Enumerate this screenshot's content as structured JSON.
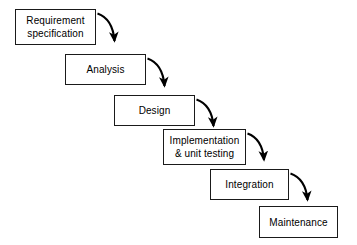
{
  "diagram": {
    "type": "flow-diagram",
    "background_color": "#ffffff",
    "box_fill_color": "#ffffff",
    "box_border_color": "#1a1a1a",
    "text_color": "#000000",
    "arrow_color": "#000000",
    "phases": [
      {
        "id": "requirement-specification",
        "lines": [
          "Requirement",
          "specification"
        ],
        "x": 15,
        "y": 9,
        "w": 81,
        "h": 36
      },
      {
        "id": "analysis",
        "lines": [
          "Analysis"
        ],
        "x": 65,
        "y": 54,
        "w": 81,
        "h": 31
      },
      {
        "id": "design",
        "lines": [
          "Design"
        ],
        "x": 114,
        "y": 95,
        "w": 81,
        "h": 31
      },
      {
        "id": "implementation-unit-testing",
        "lines": [
          "Implementation",
          "& unit testing"
        ],
        "x": 163,
        "y": 129,
        "w": 83,
        "h": 36
      },
      {
        "id": "integration",
        "lines": [
          "Integration"
        ],
        "x": 210,
        "y": 169,
        "w": 79,
        "h": 31
      },
      {
        "id": "maintenance",
        "lines": [
          "Maintenance"
        ],
        "x": 259,
        "y": 206,
        "w": 79,
        "h": 32
      }
    ],
    "arrows": [
      {
        "id": "arrow-requirement-to-analysis",
        "from": "requirement-specification",
        "to": "analysis"
      },
      {
        "id": "arrow-analysis-to-design",
        "from": "analysis",
        "to": "design"
      },
      {
        "id": "arrow-design-to-implementation",
        "from": "design",
        "to": "implementation-unit-testing"
      },
      {
        "id": "arrow-implementation-to-integration",
        "from": "implementation-unit-testing",
        "to": "integration"
      },
      {
        "id": "arrow-integration-to-maintenance",
        "from": "integration",
        "to": "maintenance"
      }
    ]
  }
}
